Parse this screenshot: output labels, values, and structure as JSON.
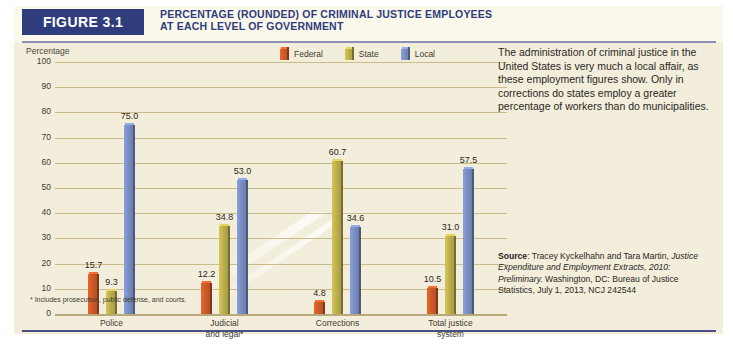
{
  "figure": {
    "tag": "FIGURE 3.1",
    "title_line1": "PERCENTAGE (ROUNDED) OF CRIMINAL JUSTICE EMPLOYEES",
    "title_line2": "AT EACH LEVEL OF GOVERNMENT",
    "accent_navy": "#2f3d7c",
    "background": "#f3eedb"
  },
  "chart_data": {
    "type": "bar",
    "title": "PERCENTAGE (ROUNDED) OF CRIMINAL JUSTICE EMPLOYEES AT EACH LEVEL OF GOVERNMENT",
    "xlabel": "",
    "ylabel": "Percentage",
    "ylim": [
      0,
      100
    ],
    "yticks": [
      0,
      10,
      20,
      30,
      40,
      50,
      60,
      70,
      80,
      90,
      100
    ],
    "grid": true,
    "legend_position": "top-right",
    "categories": [
      "Police",
      "Judicial and legal*",
      "Corrections",
      "Total justice system"
    ],
    "category_labels": [
      {
        "line1": "Police",
        "line2": ""
      },
      {
        "line1": "Judicial",
        "line2": "and legal*"
      },
      {
        "line1": "Corrections",
        "line2": ""
      },
      {
        "line1": "Total justice",
        "line2": "system"
      }
    ],
    "series": [
      {
        "name": "Federal",
        "color": "#cf5b28",
        "values": [
          15.7,
          12.2,
          4.8,
          10.5
        ]
      },
      {
        "name": "State",
        "color": "#bfb14e",
        "values": [
          9.3,
          34.8,
          60.7,
          31.0
        ]
      },
      {
        "name": "Local",
        "color": "#7a8fc4",
        "values": [
          75.0,
          53.0,
          34.6,
          57.5
        ]
      }
    ],
    "value_labels": [
      "15.7",
      "9.3",
      "75.0",
      "12.2",
      "34.8",
      "53.0",
      "4.8",
      "60.7",
      "34.6",
      "10.5",
      "31.0",
      "57.5"
    ],
    "footnote": "* Includes prosecution, public defense, and courts."
  },
  "side_panel": {
    "blurb": "The administration of criminal justice in the United States is very much a local affair, as these employment figures show. Only in corrections do states employ a greater percentage of workers than do municipalities.",
    "source_label": "Source",
    "source_rest_1": ": Tracey Kyckelhahn and Tara Martin, ",
    "source_italic": "Justice Expenditure and Employment Extracts, 2010: Preliminary.",
    "source_rest_2": " Washington, DC: Bureau of Justice Statistics, July 1, 2013, NCJ 242544"
  }
}
